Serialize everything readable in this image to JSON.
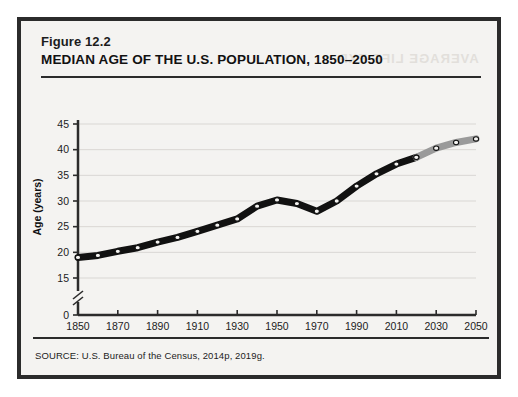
{
  "figure": {
    "number": "Figure 12.2",
    "title": "MEDIAN AGE OF THE U.S. POPULATION, 1850–2050",
    "source": "SOURCE: U.S. Bureau of the Census, 2014p,  2019g.",
    "bleed_through_artifact": "AVERAGE LIFE EXP"
  },
  "chart_data": {
    "type": "line",
    "title": "MEDIAN AGE OF THE U.S. POPULATION, 1850–2050",
    "xlabel": "",
    "ylabel": "Age (years)",
    "x": [
      1850,
      1860,
      1870,
      1880,
      1890,
      1900,
      1910,
      1920,
      1930,
      1940,
      1950,
      1960,
      1970,
      1980,
      1990,
      2000,
      2010,
      2020,
      2030,
      2040,
      2050
    ],
    "series": [
      {
        "name": "Median age (actual)",
        "color": "#111111",
        "x": [
          1850,
          1860,
          1870,
          1880,
          1890,
          1900,
          1910,
          1920,
          1930,
          1940,
          1950,
          1960,
          1970,
          1980,
          1990,
          2000,
          2010,
          2020
        ],
        "values": [
          19.0,
          19.4,
          20.2,
          20.9,
          22.0,
          22.9,
          24.1,
          25.3,
          26.5,
          29.0,
          30.2,
          29.5,
          28.0,
          30.0,
          32.9,
          35.3,
          37.2,
          38.5
        ]
      },
      {
        "name": "Median age (estimated)",
        "color": "#9a9a9a",
        "x": [
          2020,
          2030,
          2040,
          2050
        ],
        "values": [
          38.5,
          40.3,
          41.4,
          42.1
        ]
      }
    ],
    "xlim": [
      1850,
      2050
    ],
    "xticks": [
      1850,
      1870,
      1890,
      1910,
      1930,
      1950,
      1970,
      1990,
      2010,
      2030,
      2050
    ],
    "ylim": [
      15,
      45
    ],
    "yticks": [
      0,
      15,
      20,
      25,
      30,
      35,
      40,
      45
    ],
    "y_axis_break": true,
    "y_break_between": [
      0,
      15
    ],
    "grid": true,
    "legend_position": "none",
    "annotations": [
      {
        "text": "estimated",
        "span_x": [
          2030,
          2050
        ],
        "style": "bracket-below-axis"
      }
    ]
  }
}
